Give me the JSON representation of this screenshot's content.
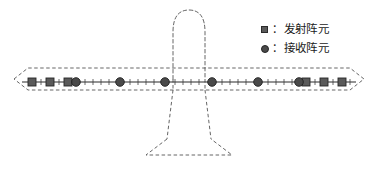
{
  "figure": {
    "background_color": "#ffffff",
    "outline_color": "#4d4d4d",
    "array_line_color": "#2b2b2b"
  },
  "legend": {
    "position": "top-right",
    "items": [
      {
        "marker": "square",
        "marker_name": "transmit-element-marker",
        "separator": "：",
        "label": "发射阵元",
        "color": "#5a5a5a"
      },
      {
        "marker": "circle",
        "marker_name": "receive-element-marker",
        "separator": "：",
        "label": "接收阵元",
        "color": "#4a4a4a"
      }
    ]
  },
  "aircraft": {
    "view": "top-down",
    "line_style": "dashed",
    "nose_dome": {
      "cx": 189,
      "cy": 50,
      "rx": 16,
      "ry": 38
    },
    "fuselage_left_x": 173,
    "fuselage_right_x": 205,
    "wing": {
      "span_left_x": 14,
      "span_right_x": 364,
      "leading_edge_y": 68,
      "trailing_edge_y": 90,
      "tip_inset": 14
    },
    "tail": {
      "top_y": 90,
      "stabilizer_top_y": 139,
      "stabilizer_bottom_y": 155,
      "stabilizer_left_x": 146,
      "stabilizer_right_x": 232,
      "root_left_x": 167,
      "root_right_x": 211
    }
  },
  "array_line": {
    "y": 82,
    "x_start": 22,
    "x_end": 356,
    "tick_half_height": 3,
    "tick_count": 61
  },
  "chart_data": {
    "type": "scatter",
    "xlabel": "",
    "ylabel": "",
    "grid": false,
    "legend_position": "top-right",
    "series": [
      {
        "name": "发射阵元",
        "marker": "square",
        "color": "#5a5a5a",
        "x": [
          32,
          50,
          68,
          306,
          324,
          342
        ],
        "y": [
          82,
          82,
          82,
          82,
          82,
          82
        ]
      },
      {
        "name": "接收阵元",
        "marker": "circle",
        "color": "#4a4a4a",
        "x": [
          76,
          120,
          165,
          212,
          258,
          299
        ],
        "y": [
          82,
          82,
          82,
          82,
          82,
          82
        ]
      }
    ]
  },
  "elements": {
    "transmit": [
      {
        "id": "tx-1",
        "x": 32
      },
      {
        "id": "tx-2",
        "x": 50
      },
      {
        "id": "tx-3",
        "x": 68
      },
      {
        "id": "tx-4",
        "x": 306
      },
      {
        "id": "tx-5",
        "x": 324
      },
      {
        "id": "tx-6",
        "x": 342
      }
    ],
    "receive": [
      {
        "id": "rx-1",
        "x": 76
      },
      {
        "id": "rx-2",
        "x": 120
      },
      {
        "id": "rx-3",
        "x": 165
      },
      {
        "id": "rx-4",
        "x": 212
      },
      {
        "id": "rx-5",
        "x": 258
      },
      {
        "id": "rx-6",
        "x": 299
      }
    ]
  }
}
